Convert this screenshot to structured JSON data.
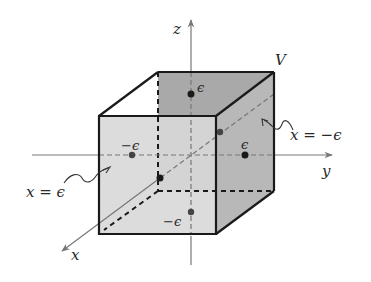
{
  "figure": {
    "volume_label": "V",
    "axes": {
      "x": "x",
      "y": "y",
      "z": "z"
    },
    "face_labels": {
      "front": "x = ϵ",
      "back": "x = −ϵ"
    },
    "point_labels": {
      "top": "ϵ",
      "bottom": "−ϵ",
      "left": "−ϵ",
      "right": "ϵ"
    },
    "colors": {
      "front_face": "#d6d6d6",
      "back_face": "#a9a9a9",
      "right_face": "#bdbdbd",
      "edges": "#1a1a1a",
      "axes": "#777777",
      "points": "#1a1a1a"
    }
  }
}
